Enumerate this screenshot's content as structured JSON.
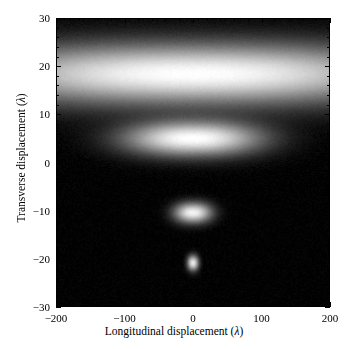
{
  "figure": {
    "type": "density-plot",
    "background_color": "#ffffff",
    "frame_color": "#000000"
  },
  "axes": {
    "x": {
      "title": "Longitudinal displacement  (λ)",
      "min": -200,
      "max": 200,
      "major_ticks": [
        -200,
        -100,
        0,
        100,
        200
      ],
      "major_tick_labels": [
        "−200",
        "−100",
        "0",
        "100",
        "200"
      ],
      "minor_tick_step": 20
    },
    "y": {
      "title": "Transverse displacement  (λ)",
      "min": -30,
      "max": 30,
      "major_ticks": [
        30,
        20,
        10,
        0,
        -10,
        -20,
        -30
      ],
      "major_tick_labels": [
        "30",
        "20",
        "10",
        "0",
        "−10",
        "−20",
        "−30"
      ],
      "minor_tick_step": 2
    }
  },
  "chart_data": {
    "type": "heatmap",
    "title": "",
    "xlabel": "Longitudinal displacement  (λ)",
    "ylabel": "Transverse displacement  (λ)",
    "xlim": [
      -200,
      200
    ],
    "ylim": [
      -30,
      30
    ],
    "grid": false,
    "legend": "none",
    "colormap": "grayscale",
    "colormap_low": "#000000",
    "colormap_high": "#ffffff",
    "background_level": 0.0,
    "noise_amplitude": 0.035,
    "features": [
      {
        "name": "broad-upper-band",
        "center_x": 0,
        "center_y": 18.5,
        "sigma_x": 320,
        "sigma_y": 6.0,
        "peak_intensity": 1.0
      },
      {
        "name": "second-band",
        "center_x": 0,
        "center_y": 5.0,
        "sigma_x": 95,
        "sigma_y": 3.4,
        "peak_intensity": 1.0
      },
      {
        "name": "third-lobe",
        "center_x": 0,
        "center_y": -10.5,
        "sigma_x": 26,
        "sigma_y": 2.0,
        "peak_intensity": 0.95
      },
      {
        "name": "fourth-spot",
        "center_x": 0,
        "center_y": -21.0,
        "sigma_x": 8,
        "sigma_y": 1.5,
        "peak_intensity": 0.9
      }
    ],
    "dark_minima_y": [
      10.5,
      -3.0,
      -16.0,
      -26.0
    ]
  }
}
